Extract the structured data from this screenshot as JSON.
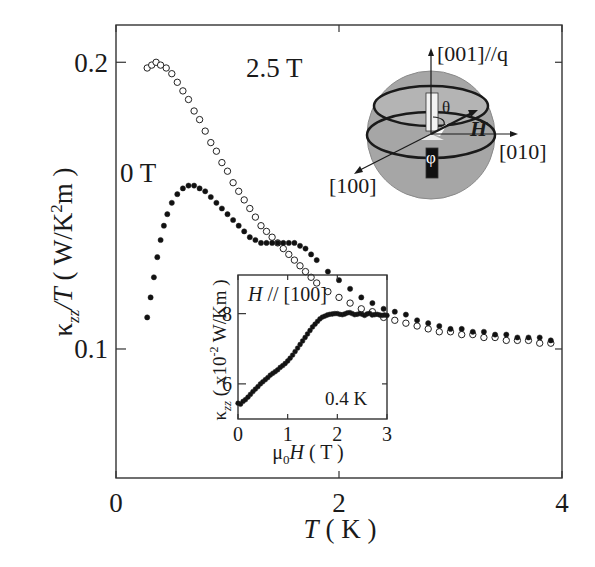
{
  "chart_data": [
    {
      "type": "scatter",
      "title": "",
      "xlabel": "T ( K )",
      "ylabel": "κzz/T ( W/K²m )",
      "xlim": [
        0,
        4
      ],
      "ylim": [
        0.055,
        0.213
      ],
      "xticks": [
        0,
        2,
        4
      ],
      "xtick_labels": [
        "0",
        "2",
        "4"
      ],
      "yticks": [
        0.1,
        0.2
      ],
      "ytick_labels": [
        "0.1",
        "0.2"
      ],
      "grid": false,
      "annotations": [
        "2.5 T",
        "0 T"
      ],
      "series": [
        {
          "name": "2.5 T",
          "marker": "open-circle",
          "x": [
            0.28,
            0.32,
            0.36,
            0.4,
            0.45,
            0.5,
            0.55,
            0.6,
            0.65,
            0.7,
            0.75,
            0.8,
            0.85,
            0.9,
            0.95,
            1.0,
            1.05,
            1.1,
            1.15,
            1.2,
            1.25,
            1.3,
            1.35,
            1.4,
            1.45,
            1.5,
            1.55,
            1.6,
            1.65,
            1.7,
            1.75,
            1.8,
            1.9,
            2.0,
            2.1,
            2.2,
            2.3,
            2.4,
            2.5,
            2.6,
            2.7,
            2.8,
            2.9,
            3.0,
            3.1,
            3.2,
            3.3,
            3.4,
            3.5,
            3.6,
            3.7,
            3.8,
            3.9
          ],
          "y": [
            0.198,
            0.199,
            0.2,
            0.199,
            0.198,
            0.196,
            0.193,
            0.19,
            0.187,
            0.183,
            0.18,
            0.176,
            0.172,
            0.169,
            0.165,
            0.162,
            0.158,
            0.155,
            0.152,
            0.149,
            0.146,
            0.143,
            0.141,
            0.139,
            0.137,
            0.135,
            0.133,
            0.131,
            0.129,
            0.127,
            0.125,
            0.123,
            0.12,
            0.118,
            0.116,
            0.114,
            0.113,
            0.111,
            0.11,
            0.109,
            0.108,
            0.107,
            0.106,
            0.106,
            0.105,
            0.105,
            0.104,
            0.104,
            0.103,
            0.103,
            0.103,
            0.102,
            0.102
          ]
        },
        {
          "name": "0 T",
          "marker": "filled-circle",
          "x": [
            0.28,
            0.31,
            0.34,
            0.37,
            0.4,
            0.43,
            0.46,
            0.5,
            0.55,
            0.6,
            0.65,
            0.7,
            0.75,
            0.8,
            0.85,
            0.9,
            0.95,
            1.0,
            1.05,
            1.1,
            1.15,
            1.2,
            1.25,
            1.3,
            1.35,
            1.4,
            1.45,
            1.5,
            1.55,
            1.6,
            1.65,
            1.7,
            1.75,
            1.8,
            1.9,
            2.0,
            2.1,
            2.2,
            2.3,
            2.4,
            2.5,
            2.6,
            2.7,
            2.8,
            2.9,
            3.0,
            3.1,
            3.2,
            3.3,
            3.4,
            3.5,
            3.6,
            3.7,
            3.8,
            3.9
          ],
          "y": [
            0.111,
            0.118,
            0.125,
            0.132,
            0.138,
            0.143,
            0.147,
            0.151,
            0.154,
            0.156,
            0.157,
            0.157,
            0.156,
            0.155,
            0.153,
            0.151,
            0.149,
            0.147,
            0.145,
            0.143,
            0.141,
            0.139,
            0.138,
            0.137,
            0.137,
            0.137,
            0.137,
            0.137,
            0.137,
            0.137,
            0.136,
            0.135,
            0.133,
            0.131,
            0.127,
            0.124,
            0.121,
            0.118,
            0.116,
            0.114,
            0.113,
            0.112,
            0.11,
            0.109,
            0.108,
            0.107,
            0.107,
            0.106,
            0.106,
            0.105,
            0.105,
            0.104,
            0.104,
            0.104,
            0.103
          ]
        }
      ]
    },
    {
      "type": "scatter",
      "title": "",
      "xlabel": "μ0H ( T )",
      "ylabel": "κzz ( x10⁻² W/Km )",
      "xlim": [
        0,
        3
      ],
      "ylim": [
        5.0,
        9.1
      ],
      "xticks": [
        0,
        1,
        2,
        3
      ],
      "xtick_labels": [
        "0",
        "1",
        "2",
        "3"
      ],
      "yticks": [
        6,
        8
      ],
      "ytick_labels": [
        "6",
        "8"
      ],
      "grid": false,
      "annotations": [
        "H // [100]",
        "0.4 K"
      ],
      "series": [
        {
          "name": "0.4 K",
          "marker": "filled-circle",
          "x": [
            0.0,
            0.05,
            0.1,
            0.15,
            0.2,
            0.25,
            0.3,
            0.35,
            0.4,
            0.45,
            0.5,
            0.55,
            0.6,
            0.65,
            0.7,
            0.75,
            0.8,
            0.85,
            0.9,
            0.95,
            1.0,
            1.05,
            1.1,
            1.15,
            1.2,
            1.25,
            1.3,
            1.35,
            1.4,
            1.45,
            1.5,
            1.55,
            1.6,
            1.65,
            1.7,
            1.75,
            1.8,
            1.85,
            1.9,
            1.95,
            2.0,
            2.05,
            2.1,
            2.15,
            2.2,
            2.25,
            2.3,
            2.35,
            2.4,
            2.45,
            2.5,
            2.55,
            2.6,
            2.65,
            2.7,
            2.75,
            2.8,
            2.85,
            2.9,
            2.95,
            3.0
          ],
          "y": [
            5.45,
            5.42,
            5.5,
            5.55,
            5.62,
            5.7,
            5.78,
            5.85,
            5.92,
            6.0,
            6.06,
            6.12,
            6.18,
            6.25,
            6.3,
            6.35,
            6.4,
            6.47,
            6.52,
            6.58,
            6.65,
            6.73,
            6.82,
            6.92,
            7.02,
            7.12,
            7.22,
            7.32,
            7.42,
            7.52,
            7.62,
            7.7,
            7.78,
            7.85,
            7.9,
            7.93,
            7.96,
            7.98,
            7.99,
            8.0,
            8.0,
            7.98,
            7.97,
            7.99,
            8.02,
            8.03,
            8.0,
            7.97,
            7.98,
            8.0,
            7.98,
            7.95,
            7.99,
            8.01,
            7.96,
            7.97,
            7.98,
            7.96,
            7.95,
            7.96,
            7.95
          ]
        }
      ]
    }
  ],
  "diagram": {
    "axis_labels": {
      "z": "[001]//q",
      "y": "[010]",
      "x": "[100]",
      "field": "H",
      "polar_angle": "θ",
      "azimuth_angle": "φ"
    },
    "colors": {
      "sphere": "#a6a6a6",
      "sphere_edge": "#8a8a8a",
      "ring": "#1a1a1a"
    }
  }
}
